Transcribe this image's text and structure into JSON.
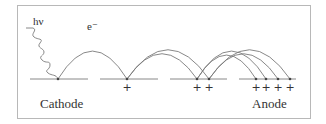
{
  "diagram": {
    "type": "electron-multiplication-cascade",
    "labels": {
      "cathode": "Cathode",
      "anode": "Anode",
      "photon": "hν",
      "electron": "e⁻",
      "ion": "+"
    },
    "baseline_y": 79,
    "segments": [
      {
        "x1": 30,
        "x2": 88
      },
      {
        "x1": 100,
        "x2": 158
      },
      {
        "x1": 170,
        "x2": 227
      },
      {
        "x1": 239,
        "x2": 296
      }
    ],
    "impacts": [
      58,
      127,
      197,
      209,
      256,
      266,
      278,
      290
    ],
    "plus_positions": [
      127,
      197,
      209,
      256,
      266,
      278,
      290
    ],
    "arcs": [
      {
        "from": 58,
        "to": 127,
        "height": 42
      },
      {
        "from": 127,
        "to": 197,
        "height": 38
      },
      {
        "from": 127,
        "to": 209,
        "height": 44
      },
      {
        "from": 197,
        "to": 256,
        "height": 36
      },
      {
        "from": 197,
        "to": 266,
        "height": 42
      },
      {
        "from": 209,
        "to": 278,
        "height": 38
      },
      {
        "from": 209,
        "to": 290,
        "height": 44
      }
    ],
    "colors": {
      "line": "#7a7a7a",
      "text": "#333333",
      "frame": "#b8b8b8"
    }
  }
}
